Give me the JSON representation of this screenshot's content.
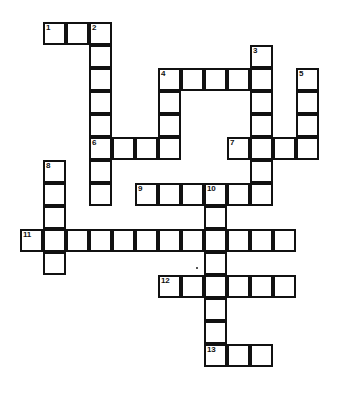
{
  "page": {
    "background_color": "#ffffff",
    "line_color": "#111111",
    "cell_fill_color": "#ffffff",
    "width": 347,
    "height": 407
  },
  "grid": {
    "cell_size": 23,
    "origin_x": 20,
    "origin_y": 22,
    "columns": 13,
    "rows": 16,
    "stroke_width": 2
  },
  "entries": [
    {
      "number": "1",
      "direction": "across",
      "row": 0,
      "col": 1,
      "length": 3
    },
    {
      "number": "2",
      "direction": "down",
      "row": 0,
      "col": 3,
      "length": 8
    },
    {
      "number": "3",
      "direction": "down",
      "row": 1,
      "col": 10,
      "length": 7
    },
    {
      "number": "4",
      "direction": "across",
      "row": 2,
      "col": 6,
      "length": 5
    },
    {
      "number": "4",
      "direction": "down",
      "row": 2,
      "col": 6,
      "length": 4
    },
    {
      "number": "5",
      "direction": "down",
      "row": 2,
      "col": 12,
      "length": 4
    },
    {
      "number": "6",
      "direction": "across",
      "row": 5,
      "col": 3,
      "length": 4
    },
    {
      "number": "7",
      "direction": "across",
      "row": 5,
      "col": 9,
      "length": 4
    },
    {
      "number": "8",
      "direction": "down",
      "row": 6,
      "col": 1,
      "length": 4
    },
    {
      "number": "9",
      "direction": "across",
      "row": 7,
      "col": 5,
      "length": 6
    },
    {
      "number": "10",
      "direction": "down",
      "row": 7,
      "col": 8,
      "length": 8
    },
    {
      "number": "11",
      "direction": "across",
      "row": 9,
      "col": 0,
      "length": 12
    },
    {
      "number": "12",
      "direction": "across",
      "row": 11,
      "col": 6,
      "length": 6
    },
    {
      "number": "13",
      "direction": "across",
      "row": 14,
      "col": 8,
      "length": 3
    }
  ],
  "cells": [
    {
      "row": 0,
      "col": 1,
      "number": "1"
    },
    {
      "row": 0,
      "col": 2,
      "number": ""
    },
    {
      "row": 0,
      "col": 3,
      "number": "2"
    },
    {
      "row": 1,
      "col": 3,
      "number": ""
    },
    {
      "row": 1,
      "col": 10,
      "number": "3"
    },
    {
      "row": 2,
      "col": 3,
      "number": ""
    },
    {
      "row": 2,
      "col": 6,
      "number": "4"
    },
    {
      "row": 2,
      "col": 7,
      "number": ""
    },
    {
      "row": 2,
      "col": 8,
      "number": ""
    },
    {
      "row": 2,
      "col": 9,
      "number": ""
    },
    {
      "row": 2,
      "col": 10,
      "number": ""
    },
    {
      "row": 2,
      "col": 12,
      "number": "5"
    },
    {
      "row": 3,
      "col": 3,
      "number": ""
    },
    {
      "row": 3,
      "col": 6,
      "number": ""
    },
    {
      "row": 3,
      "col": 10,
      "number": ""
    },
    {
      "row": 3,
      "col": 12,
      "number": ""
    },
    {
      "row": 4,
      "col": 3,
      "number": ""
    },
    {
      "row": 4,
      "col": 6,
      "number": ""
    },
    {
      "row": 4,
      "col": 10,
      "number": ""
    },
    {
      "row": 4,
      "col": 12,
      "number": ""
    },
    {
      "row": 5,
      "col": 3,
      "number": "6"
    },
    {
      "row": 5,
      "col": 4,
      "number": ""
    },
    {
      "row": 5,
      "col": 5,
      "number": ""
    },
    {
      "row": 5,
      "col": 6,
      "number": ""
    },
    {
      "row": 5,
      "col": 9,
      "number": "7"
    },
    {
      "row": 5,
      "col": 10,
      "number": ""
    },
    {
      "row": 5,
      "col": 11,
      "number": ""
    },
    {
      "row": 5,
      "col": 12,
      "number": ""
    },
    {
      "row": 6,
      "col": 1,
      "number": "8"
    },
    {
      "row": 6,
      "col": 3,
      "number": ""
    },
    {
      "row": 6,
      "col": 10,
      "number": ""
    },
    {
      "row": 7,
      "col": 1,
      "number": ""
    },
    {
      "row": 7,
      "col": 3,
      "number": ""
    },
    {
      "row": 7,
      "col": 5,
      "number": "9"
    },
    {
      "row": 7,
      "col": 6,
      "number": ""
    },
    {
      "row": 7,
      "col": 7,
      "number": ""
    },
    {
      "row": 7,
      "col": 8,
      "number": "10"
    },
    {
      "row": 7,
      "col": 9,
      "number": ""
    },
    {
      "row": 7,
      "col": 10,
      "number": ""
    },
    {
      "row": 8,
      "col": 1,
      "number": ""
    },
    {
      "row": 8,
      "col": 8,
      "number": ""
    },
    {
      "row": 9,
      "col": 0,
      "number": "11"
    },
    {
      "row": 9,
      "col": 1,
      "number": ""
    },
    {
      "row": 9,
      "col": 2,
      "number": ""
    },
    {
      "row": 9,
      "col": 3,
      "number": ""
    },
    {
      "row": 9,
      "col": 4,
      "number": ""
    },
    {
      "row": 9,
      "col": 5,
      "number": ""
    },
    {
      "row": 9,
      "col": 6,
      "number": ""
    },
    {
      "row": 9,
      "col": 7,
      "number": ""
    },
    {
      "row": 9,
      "col": 8,
      "number": ""
    },
    {
      "row": 9,
      "col": 9,
      "number": ""
    },
    {
      "row": 9,
      "col": 10,
      "number": ""
    },
    {
      "row": 9,
      "col": 11,
      "number": ""
    },
    {
      "row": 10,
      "col": 1,
      "number": ""
    },
    {
      "row": 10,
      "col": 8,
      "number": ""
    },
    {
      "row": 11,
      "col": 6,
      "number": "12"
    },
    {
      "row": 11,
      "col": 7,
      "number": ""
    },
    {
      "row": 11,
      "col": 8,
      "number": ""
    },
    {
      "row": 11,
      "col": 9,
      "number": ""
    },
    {
      "row": 11,
      "col": 10,
      "number": ""
    },
    {
      "row": 11,
      "col": 11,
      "number": ""
    },
    {
      "row": 12,
      "col": 8,
      "number": ""
    },
    {
      "row": 13,
      "col": 8,
      "number": ""
    },
    {
      "row": 14,
      "col": 8,
      "number": "13"
    },
    {
      "row": 14,
      "col": 9,
      "number": ""
    },
    {
      "row": 14,
      "col": 10,
      "number": ""
    }
  ],
  "artifacts": [
    {
      "name": "scan-speck",
      "x": 196,
      "y": 267
    }
  ]
}
